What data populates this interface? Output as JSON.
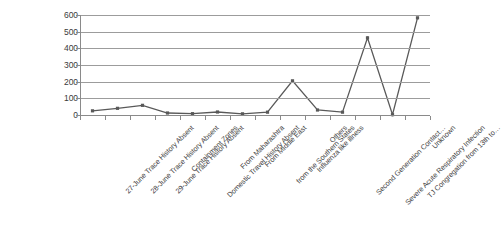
{
  "chart_data": {
    "type": "line",
    "title": "",
    "xlabel": "",
    "ylabel": "",
    "ylim": [
      0,
      600
    ],
    "ytick_step": 100,
    "yticks": [
      600,
      500,
      400,
      300,
      200,
      100,
      0
    ],
    "grid": true,
    "legend": "none",
    "marker": "square",
    "series_color": "#595959",
    "categories": [
      "27-June Trace History Absent",
      "28-June Trace History Absent",
      "29-June Trace History Absent",
      "Containment Zones",
      "Domestic Travel History Absent",
      "From Maharashtra",
      "From Middle East",
      "from the Southern States",
      "Influenza like illness",
      "Others",
      "Second Generation Contact…",
      "Severe Acute Respiratory Infection",
      "TJ Congregation from 13th to…",
      "Unknown"
    ],
    "values": [
      25,
      40,
      58,
      12,
      8,
      18,
      7,
      17,
      205,
      30,
      17,
      463,
      2,
      583
    ]
  }
}
